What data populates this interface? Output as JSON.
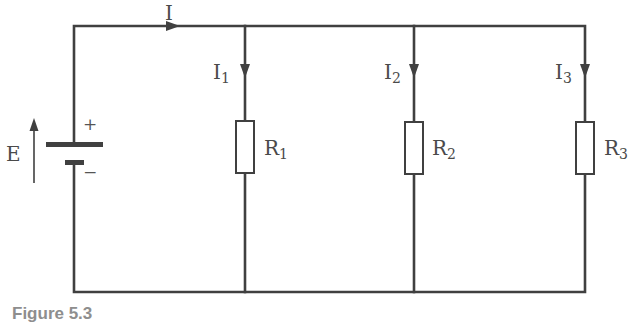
{
  "figure": {
    "caption": "Figure 5.3",
    "line_color": "#404040",
    "label_color": "#4a4a4a",
    "caption_color": "#8e8e8e"
  },
  "source": {
    "label": "E",
    "positive_sign": "+",
    "negative_sign": "−"
  },
  "main_current": {
    "label": "I"
  },
  "branches": [
    {
      "current_label": "I",
      "current_sub": "1",
      "resistor_label": "R",
      "resistor_sub": "1"
    },
    {
      "current_label": "I",
      "current_sub": "2",
      "resistor_label": "R",
      "resistor_sub": "2"
    },
    {
      "current_label": "I",
      "current_sub": "3",
      "resistor_label": "R",
      "resistor_sub": "3"
    }
  ]
}
